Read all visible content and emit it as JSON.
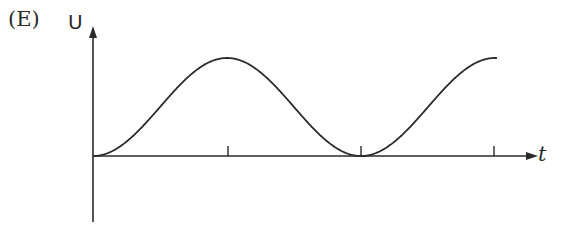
{
  "option_label": "(E)",
  "chart_data": {
    "type": "line",
    "title": "",
    "xlabel": "t",
    "ylabel": "U",
    "x_ticks": [
      "T/2",
      "T",
      "3T/2"
    ],
    "x": [
      0,
      0.25,
      0.5,
      0.75,
      1.0,
      1.25,
      1.5
    ],
    "values": [
      0,
      0.5,
      1,
      0.5,
      0,
      0.5,
      1
    ],
    "grid": false,
    "legend": null
  },
  "colors": {
    "line": "#2a2a2a",
    "background": "#ffffff"
  }
}
